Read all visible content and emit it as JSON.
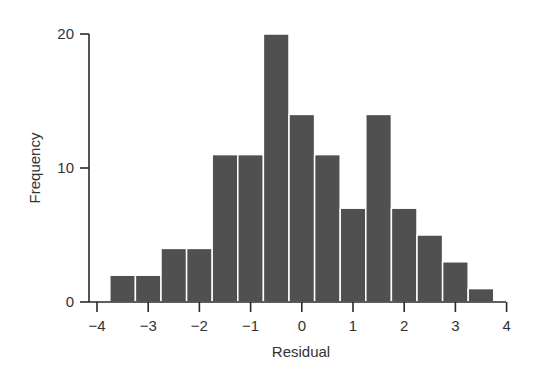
{
  "chart_data": {
    "type": "bar",
    "subtype": "histogram",
    "title": "",
    "xlabel": "Residual",
    "ylabel": "Frequency",
    "xlim": [
      -4,
      4
    ],
    "ylim": [
      0,
      20
    ],
    "xticks": [
      -4,
      -3,
      -2,
      -1,
      0,
      1,
      2,
      3,
      4
    ],
    "xtick_labels": [
      "−4",
      "−3",
      "−2",
      "−1",
      "0",
      "1",
      "2",
      "3",
      "4"
    ],
    "yticks": [
      0,
      10,
      20
    ],
    "ytick_labels": [
      "0",
      "10",
      "20"
    ],
    "grid": false,
    "legend": null,
    "bin_width": 0.5,
    "bins": [
      {
        "x0": -3.75,
        "x1": -3.25,
        "count": 2
      },
      {
        "x0": -3.25,
        "x1": -2.75,
        "count": 2
      },
      {
        "x0": -2.75,
        "x1": -2.25,
        "count": 4
      },
      {
        "x0": -2.25,
        "x1": -1.75,
        "count": 4
      },
      {
        "x0": -1.75,
        "x1": -1.25,
        "count": 11
      },
      {
        "x0": -1.25,
        "x1": -0.75,
        "count": 11
      },
      {
        "x0": -0.75,
        "x1": -0.25,
        "count": 20
      },
      {
        "x0": -0.25,
        "x1": 0.25,
        "count": 14
      },
      {
        "x0": 0.25,
        "x1": 0.75,
        "count": 11
      },
      {
        "x0": 0.75,
        "x1": 1.25,
        "count": 7
      },
      {
        "x0": 1.25,
        "x1": 1.75,
        "count": 14
      },
      {
        "x0": 1.75,
        "x1": 2.25,
        "count": 7
      },
      {
        "x0": 2.25,
        "x1": 2.75,
        "count": 5
      },
      {
        "x0": 2.75,
        "x1": 3.25,
        "count": 3
      },
      {
        "x0": 3.25,
        "x1": 3.75,
        "count": 1
      }
    ],
    "categories": [
      "-3.5",
      "-3.0",
      "-2.5",
      "-2.0",
      "-1.5",
      "-1.0",
      "-0.5",
      "0.0",
      "0.5",
      "1.0",
      "1.5",
      "2.0",
      "2.5",
      "3.0",
      "3.5"
    ],
    "values": [
      2,
      2,
      4,
      4,
      11,
      11,
      20,
      14,
      11,
      7,
      14,
      7,
      5,
      3,
      1
    ],
    "colors": {
      "bar": "#505050",
      "bar_edge": "#ffffff",
      "axis": "#2a2a2a",
      "text": "#333333"
    }
  }
}
